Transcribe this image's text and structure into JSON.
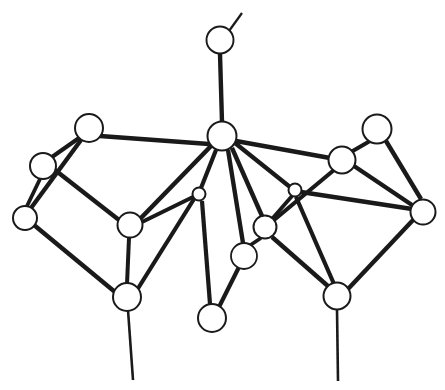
{
  "figure": {
    "background_color": "#ffffff",
    "line_color": "#1a1a1a",
    "atom_fill_color": "#ffffff",
    "canvas": {
      "width": 445,
      "height": 390
    }
  },
  "structure": {
    "atom_count": 17,
    "bond_count": 31,
    "atoms": [
      {
        "id": "a1",
        "name": "terminal-top-atom",
        "x": 220,
        "y": 40,
        "r": 13.5,
        "stroke": 1.9
      },
      {
        "id": "a2",
        "name": "apex-center-atom",
        "x": 222,
        "y": 136,
        "r": 14.5,
        "stroke": 2.0
      },
      {
        "id": "a3",
        "name": "upper-left-atom",
        "x": 89,
        "y": 128,
        "r": 14.0,
        "stroke": 2.0
      },
      {
        "id": "a4",
        "name": "left-upper-edge-atom",
        "x": 43,
        "y": 166,
        "r": 13.0,
        "stroke": 2.0
      },
      {
        "id": "a5",
        "name": "left-outer-atom",
        "x": 25,
        "y": 218,
        "r": 12.0,
        "stroke": 2.0
      },
      {
        "id": "a6",
        "name": "left-inner-atom",
        "x": 130,
        "y": 225,
        "r": 12.5,
        "stroke": 2.0
      },
      {
        "id": "a7",
        "name": "lower-left-atom",
        "x": 127,
        "y": 297,
        "r": 14.0,
        "stroke": 2.0
      },
      {
        "id": "a8",
        "name": "center-left-small-atom",
        "x": 199,
        "y": 194,
        "r": 6.5,
        "stroke": 2.0
      },
      {
        "id": "a9",
        "name": "center-right-small-atom",
        "x": 295,
        "y": 190,
        "r": 6.5,
        "stroke": 2.0
      },
      {
        "id": "a10",
        "name": "center-lower-atom",
        "x": 265,
        "y": 227,
        "r": 11.5,
        "stroke": 2.0
      },
      {
        "id": "a11",
        "name": "center-front-atom",
        "x": 244,
        "y": 256,
        "r": 13.0,
        "stroke": 1.8
      },
      {
        "id": "a12",
        "name": "bottom-center-atom",
        "x": 212,
        "y": 318,
        "r": 14.0,
        "stroke": 2.0
      },
      {
        "id": "a13",
        "name": "right-inner-atom",
        "x": 342,
        "y": 160,
        "r": 13.5,
        "stroke": 2.0
      },
      {
        "id": "a14",
        "name": "upper-right-atom",
        "x": 377,
        "y": 129,
        "r": 14.5,
        "stroke": 2.0
      },
      {
        "id": "a15",
        "name": "right-outer-atom",
        "x": 423,
        "y": 212,
        "r": 12.5,
        "stroke": 2.0
      },
      {
        "id": "a16",
        "name": "lower-right-atom",
        "x": 337,
        "y": 296,
        "r": 13.5,
        "stroke": 2.0
      },
      {
        "id": "a17",
        "name": "terminal-stub-atom",
        "x": 240,
        "y": 14,
        "r": 0.0,
        "stroke": 0.0
      }
    ],
    "bonds": [
      {
        "name": "bond-terminal-stub",
        "x1": 229,
        "y1": 31,
        "x2": 242,
        "y2": 13,
        "w": 2.2,
        "style": "single"
      },
      {
        "name": "bond-a1-a2",
        "x1": 220,
        "y1": 54,
        "x2": 222,
        "y2": 122,
        "w": 4.4,
        "style": "double"
      },
      {
        "name": "bond-a2-a3",
        "x1": 209,
        "y1": 144,
        "x2": 100,
        "y2": 136,
        "w": 4.6,
        "style": "double"
      },
      {
        "name": "bond-a2-a8",
        "x1": 216,
        "y1": 150,
        "x2": 201,
        "y2": 188,
        "w": 4.2,
        "style": "double"
      },
      {
        "name": "bond-a2-a6",
        "x1": 211,
        "y1": 146,
        "x2": 140,
        "y2": 219,
        "w": 4.6,
        "style": "double"
      },
      {
        "name": "bond-a2-a11",
        "x1": 228,
        "y1": 150,
        "x2": 243,
        "y2": 243,
        "w": 4.4,
        "style": "double"
      },
      {
        "name": "bond-a2-a10",
        "x1": 232,
        "y1": 148,
        "x2": 262,
        "y2": 216,
        "w": 4.4,
        "style": "double"
      },
      {
        "name": "bond-a2-a9",
        "x1": 235,
        "y1": 143,
        "x2": 290,
        "y2": 187,
        "w": 4.2,
        "style": "double"
      },
      {
        "name": "bond-a2-a13",
        "x1": 236,
        "y1": 141,
        "x2": 330,
        "y2": 158,
        "w": 4.6,
        "style": "double"
      },
      {
        "name": "bond-a3-a4",
        "x1": 79,
        "y1": 138,
        "x2": 52,
        "y2": 157,
        "w": 4.2,
        "style": "double"
      },
      {
        "name": "bond-a3-a5",
        "x1": 81,
        "y1": 140,
        "x2": 31,
        "y2": 208,
        "w": 4.4,
        "style": "double"
      },
      {
        "name": "bond-a4-a5",
        "x1": 40,
        "y1": 179,
        "x2": 27,
        "y2": 206,
        "w": 3.8,
        "style": "double"
      },
      {
        "name": "bond-a4-a6",
        "x1": 55,
        "y1": 170,
        "x2": 119,
        "y2": 220,
        "w": 4.4,
        "style": "double"
      },
      {
        "name": "bond-a5-a7",
        "x1": 34,
        "y1": 225,
        "x2": 115,
        "y2": 292,
        "w": 4.4,
        "style": "double"
      },
      {
        "name": "bond-a6-a7",
        "x1": 129,
        "y1": 238,
        "x2": 127,
        "y2": 284,
        "w": 4.0,
        "style": "double"
      },
      {
        "name": "bond-a6-a8",
        "x1": 142,
        "y1": 222,
        "x2": 193,
        "y2": 197,
        "w": 4.0,
        "style": "double"
      },
      {
        "name": "bond-a7-terminal",
        "x1": 128,
        "y1": 310,
        "x2": 133,
        "y2": 380,
        "w": 2.6,
        "style": "single"
      },
      {
        "name": "bond-a8-a12",
        "x1": 202,
        "y1": 201,
        "x2": 210,
        "y2": 304,
        "w": 4.2,
        "style": "double"
      },
      {
        "name": "bond-a8-a7",
        "x1": 194,
        "y1": 199,
        "x2": 137,
        "y2": 290,
        "w": 4.2,
        "style": "double"
      },
      {
        "name": "bond-a11-a12",
        "x1": 239,
        "y1": 267,
        "x2": 219,
        "y2": 307,
        "w": 4.2,
        "style": "double"
      },
      {
        "name": "bond-a10-a11",
        "x1": 261,
        "y1": 238,
        "x2": 249,
        "y2": 246,
        "w": 3.6,
        "style": "double"
      },
      {
        "name": "bond-a10-a9",
        "x1": 272,
        "y1": 219,
        "x2": 292,
        "y2": 196,
        "w": 3.8,
        "style": "double"
      },
      {
        "name": "bond-a10-a13",
        "x1": 274,
        "y1": 220,
        "x2": 334,
        "y2": 170,
        "w": 4.2,
        "style": "double"
      },
      {
        "name": "bond-a10-a16",
        "x1": 272,
        "y1": 237,
        "x2": 329,
        "y2": 287,
        "w": 4.4,
        "style": "double"
      },
      {
        "name": "bond-a9-a16",
        "x1": 296,
        "y1": 197,
        "x2": 334,
        "y2": 284,
        "w": 4.2,
        "style": "double"
      },
      {
        "name": "bond-a9-a15",
        "x1": 301,
        "y1": 192,
        "x2": 412,
        "y2": 209,
        "w": 4.4,
        "style": "double"
      },
      {
        "name": "bond-a13-a14",
        "x1": 351,
        "y1": 152,
        "x2": 370,
        "y2": 141,
        "w": 4.0,
        "style": "double"
      },
      {
        "name": "bond-a13-a15",
        "x1": 354,
        "y1": 166,
        "x2": 412,
        "y2": 205,
        "w": 4.4,
        "style": "double"
      },
      {
        "name": "bond-a14-a15",
        "x1": 386,
        "y1": 141,
        "x2": 421,
        "y2": 199,
        "w": 4.4,
        "style": "double"
      },
      {
        "name": "bond-a15-a16",
        "x1": 414,
        "y1": 219,
        "x2": 348,
        "y2": 289,
        "w": 4.4,
        "style": "double"
      },
      {
        "name": "bond-a16-terminal",
        "x1": 337,
        "y1": 309,
        "x2": 338,
        "y2": 381,
        "w": 2.6,
        "style": "single"
      }
    ]
  }
}
